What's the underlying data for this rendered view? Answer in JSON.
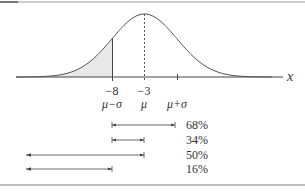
{
  "figure": {
    "axis_label": "x",
    "tick_values": {
      "mu_minus_sigma": "−8",
      "mu": "−3"
    },
    "tick_symbols": {
      "mu_minus_sigma": "μ−σ",
      "mu": "μ",
      "mu_plus_sigma": "μ+σ"
    },
    "shaded_region": "left tail, x < μ−σ",
    "intervals": [
      {
        "label": "68%",
        "from": "μ−σ",
        "to": "μ+σ"
      },
      {
        "label": "34%",
        "from": "μ−σ",
        "to": "μ"
      },
      {
        "label": "50%",
        "from": "−∞",
        "to": "μ"
      },
      {
        "label": "16%",
        "from": "−∞",
        "to": "μ−σ"
      }
    ],
    "colors": {
      "curve": "#555555",
      "shade": "#e8e8e8",
      "axis": "#444444",
      "border": "#a0a0a0",
      "border_dark": "#777777",
      "text": "#333333"
    }
  },
  "chart_data": {
    "type": "line",
    "title": "",
    "xlabel": "x",
    "ylabel": "",
    "distribution": "normal",
    "mean": -3,
    "std_dev": 5,
    "marked_points": [
      {
        "x": -8,
        "symbol": "μ−σ",
        "label": "−8"
      },
      {
        "x": -3,
        "symbol": "μ",
        "label": "−3"
      },
      {
        "x": 2,
        "symbol": "μ+σ",
        "label": ""
      }
    ],
    "shaded": {
      "from": "-inf",
      "to": -8
    },
    "intervals": [
      {
        "name": "68%",
        "start": -8,
        "end": 2,
        "probability": 0.68
      },
      {
        "name": "34%",
        "start": -8,
        "end": -3,
        "probability": 0.34
      },
      {
        "name": "50%",
        "start": "-inf",
        "end": -3,
        "probability": 0.5
      },
      {
        "name": "16%",
        "start": "-inf",
        "end": -8,
        "probability": 0.16
      }
    ],
    "grid": false,
    "legend": "none"
  }
}
